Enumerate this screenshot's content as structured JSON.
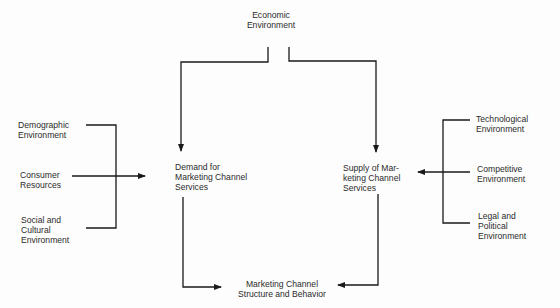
{
  "diagram": {
    "nodes": {
      "economic": {
        "label": "Economic\nEnvironment"
      },
      "demand": {
        "label": "Demand for\nMarketing Channel\nServices"
      },
      "supply": {
        "label": "Supply of Mar-\nketing Channel\nServices"
      },
      "demographic": {
        "label": "Demographic\nEnvironment"
      },
      "consumer": {
        "label": "Consumer\nResources"
      },
      "social": {
        "label": "Social and\nCultural\nEnvironment"
      },
      "technological": {
        "label": "Technological\nEnvironment"
      },
      "competitive": {
        "label": "Competitive\nEnvironment"
      },
      "legal": {
        "label": "Legal and\nPolitical\nEnvironment"
      },
      "structure": {
        "label": "Marketing Channel\nStructure and Behavior"
      }
    },
    "edges": [
      {
        "from": "economic",
        "to": "demand"
      },
      {
        "from": "economic",
        "to": "supply"
      },
      {
        "from": "demographic",
        "to": "demand"
      },
      {
        "from": "consumer",
        "to": "demand"
      },
      {
        "from": "social",
        "to": "demand"
      },
      {
        "from": "technological",
        "to": "supply"
      },
      {
        "from": "competitive",
        "to": "supply"
      },
      {
        "from": "legal",
        "to": "supply"
      },
      {
        "from": "demand",
        "to": "structure"
      },
      {
        "from": "supply",
        "to": "structure"
      }
    ],
    "line_color": "#1a1a1a"
  }
}
